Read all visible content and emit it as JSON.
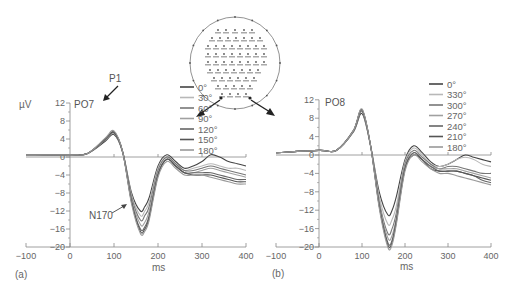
{
  "chart_data": [
    {
      "type": "line",
      "panel": "(a)",
      "title": "PO7",
      "xlabel": "ms",
      "ylabel": "µV",
      "xlim": [
        -100,
        400
      ],
      "ylim": [
        -20,
        12
      ],
      "x_ticks": [
        "−100",
        "0",
        "100",
        "200",
        "300",
        "400"
      ],
      "y_ticks": [
        "12",
        "8",
        "4",
        "0",
        "−4",
        "−8",
        "−12",
        "−16",
        "−20"
      ],
      "annotations": [
        "P1",
        "N170"
      ],
      "legend": [
        "0°",
        "30°",
        "60°",
        "90°",
        "120°",
        "150°",
        "180°"
      ],
      "x": [
        -100,
        0,
        40,
        80,
        100,
        120,
        140,
        160,
        170,
        180,
        200,
        220,
        240,
        260,
        280,
        300,
        320,
        340,
        360,
        380,
        400
      ],
      "series": [
        {
          "name": "0°",
          "values": [
            0.5,
            0.5,
            0.8,
            3.5,
            5.0,
            1.0,
            -8.0,
            -12.0,
            -11.0,
            -9.0,
            -2.0,
            0.5,
            -1.0,
            -2.5,
            -2.0,
            -1.0,
            0.5,
            0.0,
            -1.0,
            -1.5,
            -2.0
          ]
        },
        {
          "name": "30°",
          "values": [
            0.5,
            0.5,
            0.8,
            3.8,
            5.3,
            1.0,
            -8.5,
            -13.0,
            -12.0,
            -10.0,
            -2.5,
            0.0,
            -1.5,
            -3.0,
            -2.5,
            -2.0,
            -1.5,
            -2.0,
            -2.5,
            -2.5,
            -3.0
          ]
        },
        {
          "name": "60°",
          "values": [
            0.5,
            0.5,
            0.8,
            3.8,
            5.3,
            1.0,
            -9.0,
            -14.0,
            -13.0,
            -11.0,
            -3.0,
            0.0,
            -1.5,
            -3.0,
            -3.0,
            -2.5,
            -2.0,
            -2.5,
            -3.0,
            -3.5,
            -4.0
          ]
        },
        {
          "name": "90°",
          "values": [
            0.5,
            0.5,
            0.8,
            4.0,
            5.5,
            1.0,
            -9.5,
            -15.0,
            -14.5,
            -12.0,
            -3.5,
            -0.5,
            -2.0,
            -3.5,
            -3.5,
            -3.0,
            -2.5,
            -3.0,
            -3.5,
            -4.0,
            -4.5
          ]
        },
        {
          "name": "120°",
          "values": [
            0.5,
            0.5,
            0.8,
            4.0,
            5.5,
            1.0,
            -10.0,
            -16.0,
            -15.5,
            -13.0,
            -4.0,
            -0.5,
            -2.0,
            -3.5,
            -3.5,
            -3.5,
            -3.5,
            -4.0,
            -4.5,
            -5.0,
            -5.0
          ]
        },
        {
          "name": "150°",
          "values": [
            0.5,
            0.5,
            0.8,
            4.0,
            5.5,
            1.0,
            -10.0,
            -16.5,
            -16.0,
            -13.5,
            -4.0,
            -0.5,
            -2.0,
            -3.5,
            -4.0,
            -4.0,
            -4.0,
            -4.5,
            -5.0,
            -5.5,
            -5.5
          ]
        },
        {
          "name": "180°",
          "values": [
            0.5,
            0.5,
            0.8,
            4.2,
            5.8,
            1.0,
            -10.5,
            -17.0,
            -16.5,
            -14.0,
            -4.5,
            -1.0,
            -2.5,
            -4.0,
            -4.0,
            -4.0,
            -4.5,
            -5.0,
            -5.5,
            -6.0,
            -6.0
          ]
        }
      ]
    },
    {
      "type": "line",
      "panel": "(b)",
      "title": "PO8",
      "xlabel": "ms",
      "ylabel": "µV",
      "xlim": [
        -100,
        400
      ],
      "ylim": [
        -20,
        12
      ],
      "x_ticks": [
        "−100",
        "0",
        "100",
        "200",
        "300",
        "400"
      ],
      "y_ticks": [
        "12",
        "8",
        "4",
        "0",
        "−4",
        "−8",
        "−12",
        "−16",
        "−20"
      ],
      "legend": [
        "0°",
        "330°",
        "300°",
        "270°",
        "240°",
        "210°",
        "180°"
      ],
      "x": [
        -100,
        0,
        40,
        80,
        100,
        120,
        140,
        160,
        170,
        180,
        200,
        220,
        240,
        260,
        280,
        300,
        320,
        340,
        360,
        380,
        400
      ],
      "series": [
        {
          "name": "0°",
          "values": [
            0.5,
            1.0,
            1.0,
            5.0,
            9.0,
            2.0,
            -8.0,
            -13.0,
            -12.0,
            -9.0,
            -1.0,
            2.0,
            0.5,
            -1.5,
            -2.5,
            -2.0,
            -1.0,
            0.0,
            -0.5,
            -1.0,
            -1.5
          ]
        },
        {
          "name": "330°",
          "values": [
            0.5,
            1.0,
            1.0,
            5.2,
            9.5,
            2.0,
            -9.0,
            -15.0,
            -14.0,
            -11.0,
            -1.5,
            1.5,
            0.0,
            -2.0,
            -2.5,
            -2.0,
            -1.0,
            -0.5,
            -1.0,
            -2.0,
            -2.5
          ]
        },
        {
          "name": "300°",
          "values": [
            0.5,
            1.0,
            1.0,
            5.2,
            9.5,
            2.0,
            -10.0,
            -17.0,
            -16.0,
            -12.5,
            -2.0,
            1.0,
            -0.5,
            -2.0,
            -3.0,
            -2.5,
            -2.5,
            -3.0,
            -3.5,
            -4.0,
            -4.0
          ]
        },
        {
          "name": "270°",
          "values": [
            0.5,
            1.0,
            1.0,
            5.3,
            9.8,
            2.0,
            -10.5,
            -18.0,
            -17.5,
            -13.5,
            -2.5,
            0.5,
            -1.0,
            -2.5,
            -3.0,
            -3.0,
            -3.0,
            -3.5,
            -4.0,
            -4.5,
            -5.0
          ]
        },
        {
          "name": "240°",
          "values": [
            0.5,
            1.0,
            1.0,
            5.3,
            9.8,
            2.0,
            -11.0,
            -19.0,
            -18.5,
            -14.0,
            -3.0,
            0.5,
            -1.0,
            -2.5,
            -3.5,
            -3.5,
            -3.5,
            -4.0,
            -4.5,
            -5.5,
            -6.0
          ]
        },
        {
          "name": "210°",
          "values": [
            0.5,
            1.0,
            1.0,
            5.3,
            9.8,
            2.0,
            -11.0,
            -19.5,
            -19.0,
            -14.5,
            -3.0,
            0.0,
            -1.0,
            -3.0,
            -3.5,
            -3.5,
            -3.5,
            -4.0,
            -4.5,
            -5.0,
            -5.5
          ]
        },
        {
          "name": "180°",
          "values": [
            0.5,
            1.0,
            1.0,
            5.3,
            10.0,
            2.0,
            -11.5,
            -20.0,
            -19.5,
            -15.0,
            -3.5,
            0.0,
            -1.5,
            -3.0,
            -4.0,
            -4.0,
            -4.5,
            -5.0,
            -5.5,
            -6.0,
            -6.5
          ]
        }
      ]
    }
  ],
  "panels": {
    "a": {
      "label": "(a)",
      "unit": "µV",
      "channel": "PO7",
      "xlabel": "ms",
      "p1": "P1",
      "n170": "N170",
      "x_ticks": [
        "−100",
        "0",
        "100",
        "200",
        "300",
        "400"
      ],
      "y_ticks": [
        "12",
        "8",
        "4",
        "0",
        "−4",
        "−8",
        "−12",
        "−16",
        "−20"
      ],
      "legend": [
        "0°",
        "30°",
        "60°",
        "90°",
        "120°",
        "150°",
        "180°"
      ]
    },
    "b": {
      "label": "(b)",
      "channel": "PO8",
      "xlabel": "ms",
      "x_ticks": [
        "−100",
        "0",
        "100",
        "200",
        "300",
        "400"
      ],
      "y_ticks": [
        "12",
        "8",
        "4",
        "0",
        "−4",
        "−8",
        "−12",
        "−16",
        "−20"
      ],
      "legend": [
        "0°",
        "330°",
        "300°",
        "270°",
        "240°",
        "210°",
        "180°"
      ]
    },
    "headmap": {
      "electrodes": [
        "PO7",
        "PO8"
      ]
    }
  },
  "colors": {
    "series": [
      "#444444",
      "#b8b8b8",
      "#777777",
      "#a0a0a0",
      "#666666",
      "#555555",
      "#999999"
    ]
  }
}
